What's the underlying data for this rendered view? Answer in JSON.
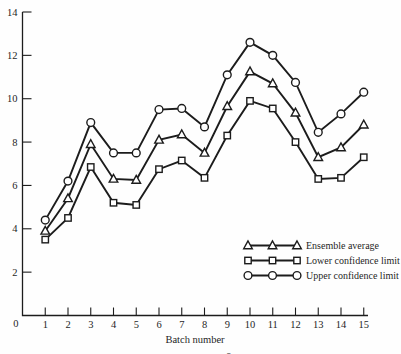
{
  "figure": {
    "background": "#fefefe",
    "ink_color": "#1c1c1c",
    "caption_fragment": "x̄"
  },
  "chart_data": {
    "type": "line",
    "title": "",
    "xlabel": "Batch number",
    "ylabel": "",
    "x": [
      1,
      2,
      3,
      4,
      5,
      6,
      7,
      8,
      9,
      10,
      11,
      12,
      13,
      14,
      15
    ],
    "xlim": [
      0,
      15.2
    ],
    "ylim": [
      0,
      14
    ],
    "yticks": [
      0,
      2,
      4,
      6,
      8,
      10,
      12,
      14
    ],
    "grid": false,
    "legend_position": "inside lower right",
    "series": [
      {
        "name": "Ensemble average",
        "marker": "triangle",
        "color": "#1c1c1c",
        "values": [
          3.9,
          5.4,
          7.9,
          6.3,
          6.25,
          8.1,
          8.35,
          7.5,
          9.65,
          11.25,
          10.7,
          9.35,
          7.3,
          7.75,
          8.8
        ]
      },
      {
        "name": "Lower confidence limit",
        "marker": "square",
        "color": "#1c1c1c",
        "values": [
          3.5,
          4.5,
          6.85,
          5.2,
          5.1,
          6.75,
          7.15,
          6.35,
          8.3,
          9.9,
          9.55,
          8.0,
          6.3,
          6.35,
          7.3
        ]
      },
      {
        "name": "Upper confidence limit",
        "marker": "circle",
        "color": "#1c1c1c",
        "values": [
          4.4,
          6.2,
          8.9,
          7.5,
          7.5,
          9.5,
          9.55,
          8.7,
          11.1,
          12.6,
          12.0,
          10.75,
          8.45,
          9.3,
          10.3
        ]
      }
    ]
  }
}
